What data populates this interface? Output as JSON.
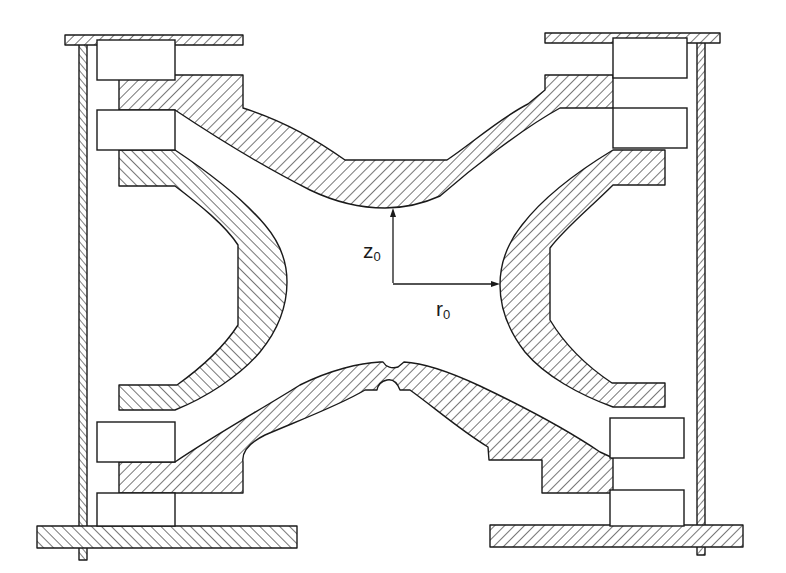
{
  "diagram": {
    "style": "hatched technical line drawing",
    "colors": {
      "ink": "#1a1a1a",
      "background": "#ffffff"
    },
    "components": [
      {
        "id": "top-endcap",
        "label": "upper end-cap electrode (hyperbolic)"
      },
      {
        "id": "bottom-endcap",
        "label": "lower end-cap electrode (hyperbolic, with central aperture)"
      },
      {
        "id": "ring-left",
        "label": "ring electrode (left section)"
      },
      {
        "id": "ring-right",
        "label": "ring electrode (right section)"
      },
      {
        "id": "insulators",
        "label": "insulating spacer blocks",
        "count": 8
      },
      {
        "id": "support-plates",
        "label": "top and bottom mounting plates",
        "count": 4
      },
      {
        "id": "support-walls",
        "label": "vertical support walls",
        "count": 2
      }
    ],
    "dimensions": {
      "z0": {
        "symbol": "z",
        "subscript": "0",
        "meaning": "center to end-cap apex"
      },
      "r0": {
        "symbol": "r",
        "subscript": "0",
        "meaning": "center to ring apex"
      }
    }
  }
}
